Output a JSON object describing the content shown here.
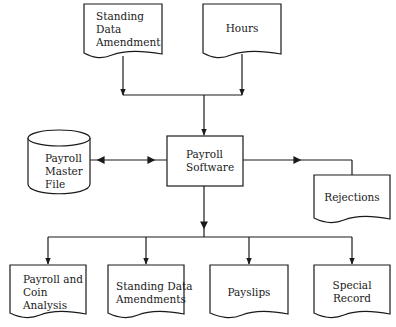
{
  "diagram": {
    "type": "system flowchart",
    "colors": {
      "stroke": "#1a1a1a",
      "background": "#ffffff"
    },
    "inputs": [
      {
        "id": "standing-data-amendment",
        "shape": "document",
        "label": "Standing Data Amendment",
        "lines": [
          "Standing",
          "Data",
          "Amendment"
        ]
      },
      {
        "id": "hours",
        "shape": "document",
        "label": "Hours",
        "lines": [
          "Hours"
        ]
      }
    ],
    "process": {
      "id": "payroll-software",
      "shape": "rectangle",
      "label": "Payroll Software",
      "lines": [
        "Payroll",
        "Software"
      ]
    },
    "storage": {
      "id": "payroll-master-file",
      "shape": "cylinder",
      "label": "Payroll Master File",
      "lines": [
        "Payroll",
        "Master",
        "File"
      ]
    },
    "side_output": {
      "id": "rejections",
      "shape": "document",
      "label": "Rejections",
      "lines": [
        "Rejections"
      ]
    },
    "outputs": [
      {
        "id": "payroll-coin-analysis",
        "shape": "document",
        "label": "Payroll and Coin Analysis",
        "lines": [
          "Payroll and",
          "Coin",
          "Analysis"
        ]
      },
      {
        "id": "standing-data-amendments",
        "shape": "document",
        "label": "Standing Data Amendments",
        "lines": [
          "Standing Data",
          "Amendments"
        ]
      },
      {
        "id": "payslips",
        "shape": "document",
        "label": "Payslips",
        "lines": [
          "Payslips"
        ]
      },
      {
        "id": "special-record",
        "shape": "document",
        "label": "Special Record",
        "lines": [
          "Special",
          "Record"
        ]
      }
    ],
    "edges": [
      {
        "from": "standing-data-amendment",
        "to": "payroll-software"
      },
      {
        "from": "hours",
        "to": "payroll-software"
      },
      {
        "from": "payroll-software",
        "to": "payroll-master-file",
        "bidirectional": true
      },
      {
        "from": "payroll-software",
        "to": "rejections"
      },
      {
        "from": "payroll-software",
        "to": "payroll-coin-analysis"
      },
      {
        "from": "payroll-software",
        "to": "standing-data-amendments"
      },
      {
        "from": "payroll-software",
        "to": "payslips"
      },
      {
        "from": "payroll-software",
        "to": "special-record"
      }
    ]
  }
}
